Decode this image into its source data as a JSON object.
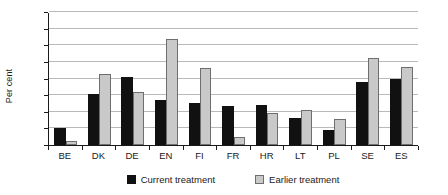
{
  "chart_data": {
    "type": "bar",
    "title": "",
    "xlabel": "",
    "ylabel": "Per cent",
    "ylim": [
      0,
      80
    ],
    "ytick_step": 10,
    "yticks": [
      "0",
      "10",
      "20",
      "30",
      "40",
      "50",
      "60",
      "70",
      "80"
    ],
    "grid": true,
    "legend_position": "bottom",
    "categories": [
      "BE",
      "DK",
      "DE",
      "EN",
      "FI",
      "FR",
      "HR",
      "LT",
      "PL",
      "SE",
      "ES"
    ],
    "series": [
      {
        "name": "Current treatment",
        "color": "#111111",
        "values": [
          10.5,
          31,
          41,
          27,
          25.5,
          23.5,
          24.5,
          16.5,
          9,
          38,
          40
        ]
      },
      {
        "name": "Earlier treatment",
        "color": "#c9c9c9",
        "values": [
          2.5,
          43,
          32,
          64.5,
          46.5,
          5,
          19.5,
          21.5,
          15.5,
          53,
          47
        ]
      }
    ]
  },
  "legend": {
    "items": [
      {
        "label": "Current treatment",
        "swatch": "black-square-icon"
      },
      {
        "label": "Earlier treatment",
        "swatch": "gray-square-icon"
      }
    ]
  }
}
